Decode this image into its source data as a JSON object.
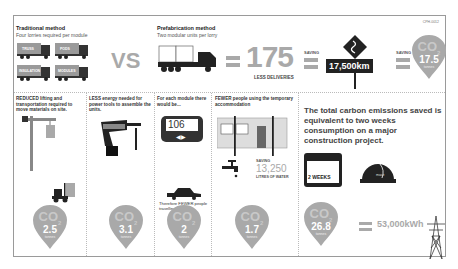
{
  "header_code": "CPH-0012",
  "traditional": {
    "title": "Traditional method",
    "subtitle": "Four lorries required per module",
    "trucks": [
      "TRUSS",
      "PODS",
      "INSULATION",
      "MODULES"
    ]
  },
  "vs_label": "VS",
  "prefab": {
    "title": "Prefabrication method",
    "subtitle": "Two modular units per lorry"
  },
  "deliveries": {
    "value": "175",
    "label": "LESS DELIVERIES"
  },
  "saving_label_1": "SAVING",
  "distance": "17,500km",
  "saving_label_2": "SAVING",
  "top_pin": {
    "co": "CO",
    "sub": "2",
    "value": "17.5",
    "unit": "tonnes"
  },
  "columns": [
    {
      "caption": "REDUCED lifting and transportation required to move materials on site.",
      "pin": {
        "co": "CO",
        "sub": "2",
        "value": "2.5",
        "unit": "tonnes"
      }
    },
    {
      "caption": "LESS energy needed for power tools to assemble the units.",
      "pin": {
        "co": "CO",
        "sub": "2",
        "value": "3.1",
        "unit": "tonnes"
      }
    },
    {
      "caption": "For each module there would be...",
      "display": "106",
      "caption2": "Therefore FEWER people travelling to site.",
      "pin": {
        "co": "CO",
        "sub": "2",
        "value": "2",
        "unit": "tonnes"
      }
    },
    {
      "caption": "FEWER people using the temporary accommodation",
      "water_saving_label": "SAVING",
      "water_value": "13,250",
      "water_unit": "LITRES OF WATER",
      "pin": {
        "co": "CO",
        "sub": "2",
        "value": "1.7",
        "unit": "tonnes"
      }
    }
  ],
  "summary": {
    "text": "The total carbon emissions saved is equivalent to two weeks consumption on a major construction project.",
    "calendar_label": "2 WEEKS",
    "helmet_brand": "mace",
    "pin": {
      "co": "CO",
      "sub": "2",
      "value": "26.8",
      "unit": "tonnes"
    },
    "energy": "53,000kWh"
  }
}
